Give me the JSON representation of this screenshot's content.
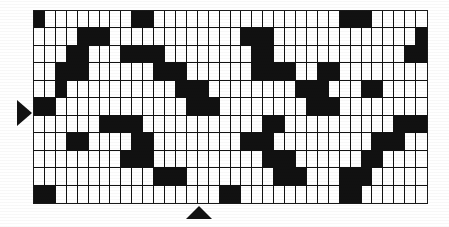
{
  "figure": {
    "type": "binary-grid-matrix",
    "grid": {
      "columns": 36,
      "rows": 11,
      "cell_on_color": "#111111",
      "cell_off_color": "#ffffff",
      "grid_line_color": "#111111",
      "border_color": "#1a1a1a",
      "legend": {
        "0": "white cell (off)",
        "1": "black cell (on)"
      },
      "matrix": [
        [
          1,
          0,
          0,
          0,
          0,
          0,
          0,
          0,
          0,
          1,
          1,
          0,
          0,
          0,
          0,
          0,
          0,
          0,
          0,
          0,
          0,
          0,
          0,
          0,
          0,
          0,
          0,
          0,
          1,
          1,
          1,
          0,
          0,
          0,
          0,
          0
        ],
        [
          0,
          0,
          0,
          0,
          1,
          1,
          1,
          0,
          0,
          0,
          0,
          0,
          0,
          0,
          0,
          0,
          0,
          0,
          0,
          1,
          1,
          1,
          0,
          0,
          0,
          0,
          0,
          0,
          0,
          0,
          0,
          0,
          0,
          0,
          0,
          1
        ],
        [
          0,
          0,
          0,
          1,
          1,
          0,
          0,
          0,
          1,
          1,
          1,
          1,
          0,
          0,
          0,
          0,
          0,
          0,
          0,
          0,
          1,
          1,
          0,
          0,
          0,
          0,
          0,
          0,
          0,
          0,
          0,
          0,
          0,
          0,
          1,
          1
        ],
        [
          0,
          0,
          1,
          1,
          1,
          0,
          0,
          0,
          0,
          0,
          0,
          1,
          1,
          1,
          0,
          0,
          0,
          0,
          0,
          0,
          1,
          1,
          1,
          1,
          0,
          0,
          1,
          1,
          0,
          0,
          0,
          0,
          0,
          0,
          0,
          0
        ],
        [
          0,
          0,
          1,
          0,
          0,
          0,
          0,
          0,
          0,
          0,
          0,
          0,
          0,
          1,
          1,
          1,
          0,
          0,
          0,
          0,
          0,
          0,
          0,
          0,
          1,
          1,
          1,
          0,
          0,
          0,
          1,
          1,
          0,
          0,
          0,
          0
        ],
        [
          1,
          1,
          0,
          0,
          0,
          0,
          0,
          0,
          0,
          0,
          0,
          0,
          0,
          0,
          1,
          1,
          1,
          0,
          0,
          0,
          0,
          0,
          0,
          0,
          0,
          1,
          1,
          1,
          0,
          0,
          0,
          0,
          0,
          0,
          0,
          0
        ],
        [
          0,
          0,
          0,
          0,
          0,
          0,
          1,
          1,
          1,
          1,
          0,
          0,
          0,
          0,
          0,
          0,
          0,
          0,
          0,
          0,
          0,
          1,
          1,
          0,
          0,
          0,
          0,
          0,
          0,
          0,
          0,
          0,
          0,
          1,
          1,
          1
        ],
        [
          0,
          0,
          0,
          1,
          1,
          0,
          0,
          0,
          0,
          1,
          1,
          0,
          0,
          0,
          0,
          0,
          0,
          0,
          0,
          1,
          1,
          1,
          0,
          0,
          0,
          0,
          0,
          0,
          0,
          0,
          0,
          1,
          1,
          1,
          0,
          0
        ],
        [
          0,
          0,
          0,
          0,
          0,
          0,
          0,
          0,
          1,
          1,
          1,
          0,
          0,
          0,
          0,
          0,
          0,
          0,
          0,
          0,
          0,
          1,
          1,
          1,
          0,
          0,
          0,
          0,
          0,
          0,
          1,
          1,
          0,
          0,
          0,
          0
        ],
        [
          0,
          0,
          0,
          0,
          0,
          0,
          0,
          0,
          0,
          0,
          0,
          1,
          1,
          1,
          0,
          0,
          0,
          0,
          0,
          0,
          0,
          0,
          1,
          1,
          1,
          0,
          0,
          0,
          1,
          1,
          1,
          0,
          0,
          0,
          0,
          0
        ],
        [
          1,
          1,
          0,
          0,
          0,
          0,
          0,
          0,
          0,
          0,
          0,
          0,
          0,
          0,
          0,
          0,
          0,
          1,
          1,
          0,
          0,
          0,
          0,
          0,
          0,
          0,
          0,
          0,
          1,
          1,
          0,
          0,
          0,
          0,
          0,
          0
        ]
      ]
    },
    "markers": {
      "row_marker": {
        "shape": "triangle-right",
        "color": "#121212",
        "position": "left edge",
        "points_at_row": 6
      },
      "column_marker": {
        "shape": "triangle-up",
        "color": "#121212",
        "position": "bottom edge",
        "points_at_column": 15
      }
    }
  }
}
